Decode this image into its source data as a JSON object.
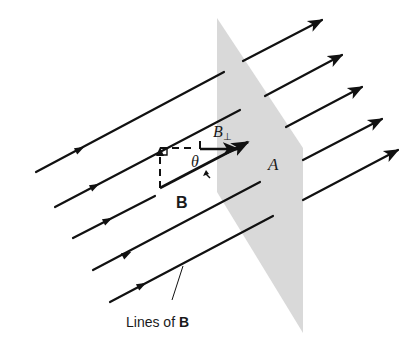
{
  "figure": {
    "colors": {
      "background": "#ffffff",
      "plane_fill": "#d9d9d9",
      "line": "#111111"
    },
    "plane": {
      "label": "A",
      "points": "217,18 303,148 303,333 217,192"
    },
    "field_lines": [
      {
        "name": "field-line-1",
        "left": [
          36,
          172,
          224,
          72
        ],
        "right": [
          243,
          61,
          314,
          24
        ],
        "tip": [
          322,
          20
        ],
        "marker": [
          80,
          149
        ]
      },
      {
        "name": "field-line-2",
        "left": [
          55,
          207,
          240,
          110
        ],
        "right": [
          265,
          96,
          334,
          59
        ],
        "tip": [
          342,
          55
        ],
        "marker": [
          95,
          186
        ]
      },
      {
        "name": "field-line-3",
        "left": [
          73,
          238,
          155,
          196
        ],
        "right": [
          286,
          127,
          354,
          91
        ],
        "tip": [
          362,
          87
        ],
        "marker": [
          108,
          220
        ]
      },
      {
        "name": "field-line-4",
        "left": [
          93,
          270,
          260,
          182
        ],
        "right": [
          303,
          160,
          374,
          123
        ],
        "tip": [
          382,
          119
        ],
        "marker": [
          127,
          254
        ]
      },
      {
        "name": "field-line-5",
        "left": [
          110,
          302,
          273,
          216
        ],
        "right": [
          303,
          200,
          390,
          154
        ],
        "tip": [
          398,
          150
        ],
        "marker": [
          142,
          285
        ]
      }
    ],
    "vector_B": {
      "label": "B",
      "from": [
        160,
        188
      ],
      "to": [
        248,
        142
      ]
    },
    "component_B_perp": {
      "label": "B",
      "subscript": "⊥",
      "from": [
        200,
        149
      ],
      "to": [
        238,
        149
      ]
    },
    "angle": {
      "label": "θ"
    },
    "callout": {
      "label_prefix": "Lines of ",
      "label_bold": "B"
    }
  }
}
